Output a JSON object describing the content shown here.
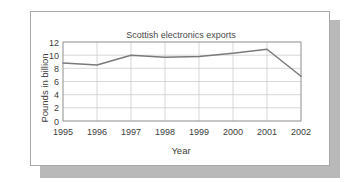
{
  "card": {
    "background_color": "#ffffff",
    "border_color": "#a8a8a8",
    "shadow_color": "#b9b9b9"
  },
  "chart_data": {
    "type": "line",
    "title": "Scottish electronics exports",
    "xlabel": "Year",
    "ylabel": "Pounds in billion",
    "categories": [
      "1995",
      "1996",
      "1997",
      "1998",
      "1999",
      "2000",
      "2001",
      "2002"
    ],
    "x": [
      1995,
      1996,
      1997,
      1998,
      1999,
      2000,
      2001,
      2002
    ],
    "values": [
      8.8,
      8.5,
      10.0,
      9.7,
      9.8,
      10.3,
      10.9,
      6.8
    ],
    "series": [
      {
        "name": "Scottish electronics exports",
        "values": [
          8.8,
          8.5,
          10.0,
          9.7,
          9.8,
          10.3,
          10.9,
          6.8
        ],
        "color": "#7a7a7a"
      }
    ],
    "ylim": [
      0,
      12
    ],
    "ytick_labels": [
      "0",
      "2",
      "4",
      "6",
      "8",
      "10",
      "12"
    ],
    "yticks": [
      0,
      2,
      4,
      6,
      8,
      10,
      12
    ],
    "xtick_labels": [
      "1995",
      "1996",
      "1997",
      "1998",
      "1999",
      "2000",
      "2001",
      "2002"
    ],
    "grid": true,
    "grid_color": "#c7c7c7",
    "legend": false,
    "legend_position": "none",
    "frame_color": "#9a9a9a",
    "line_color": "#7a7a7a",
    "markers": false
  }
}
